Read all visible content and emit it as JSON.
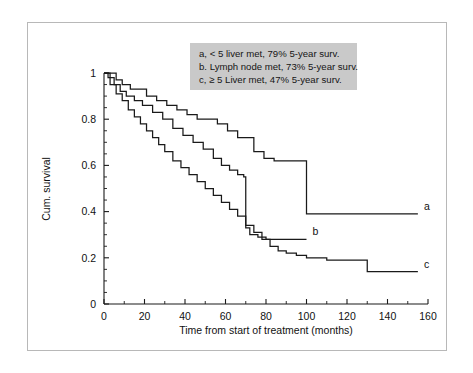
{
  "figure": {
    "legend": {
      "lines": [
        "a, < 5 liver met, 79% 5-year surv.",
        "b. Lymph node met, 73% 5-year surv.",
        "c, ≥ 5 Liver met, 47% 5-year surv."
      ]
    },
    "curve_labels": {
      "a": "a",
      "b": "b",
      "c": "c"
    }
  },
  "chart_data": {
    "type": "line",
    "title": "",
    "xlabel": "Time from start of treatment (months)",
    "ylabel": "Cum. survival",
    "xlim": [
      0,
      160
    ],
    "ylim": [
      0,
      1
    ],
    "xticks": [
      0,
      20,
      40,
      60,
      80,
      100,
      120,
      140,
      160
    ],
    "xtick_labels": [
      "0",
      "20",
      "40",
      "60",
      "80",
      "100",
      "120",
      "140",
      "160"
    ],
    "xminor_step": 10,
    "yticks": [
      0,
      0.2,
      0.4,
      0.6,
      0.8,
      1
    ],
    "ytick_labels": [
      "0",
      "0.2",
      "0.4",
      "0.6",
      "0.8",
      "1"
    ],
    "yminor_step": 0.05,
    "grid": false,
    "legend_position": "top-center",
    "step_style": "post",
    "series": [
      {
        "name": "a",
        "label": "a, < 5 liver met, 79% 5-year surv.",
        "five_year_survival": 0.79,
        "end_label": "a",
        "color": "#1a1a1a",
        "x": [
          0,
          3,
          6,
          9,
          13,
          17,
          21,
          26,
          31,
          36,
          41,
          46,
          51,
          56,
          61,
          66,
          70,
          74,
          79,
          84,
          89,
          100,
          155
        ],
        "y": [
          1.0,
          1.0,
          0.97,
          0.95,
          0.93,
          0.93,
          0.9,
          0.88,
          0.86,
          0.84,
          0.82,
          0.8,
          0.8,
          0.78,
          0.75,
          0.72,
          0.72,
          0.66,
          0.63,
          0.62,
          0.62,
          0.39,
          0.39
        ]
      },
      {
        "name": "b",
        "label": "b. Lymph node met, 73% 5-year surv.",
        "five_year_survival": 0.73,
        "end_label": "b",
        "color": "#1a1a1a",
        "x": [
          0,
          2,
          5,
          8,
          11,
          15,
          19,
          24,
          29,
          34,
          39,
          44,
          49,
          54,
          58,
          62,
          66,
          69,
          70,
          72,
          76,
          80,
          100
        ],
        "y": [
          1.0,
          0.98,
          0.95,
          0.92,
          0.9,
          0.88,
          0.86,
          0.83,
          0.8,
          0.76,
          0.73,
          0.7,
          0.67,
          0.63,
          0.6,
          0.58,
          0.56,
          0.55,
          0.33,
          0.3,
          0.29,
          0.28,
          0.28
        ]
      },
      {
        "name": "c",
        "label": "c, ≥ 5 Liver met, 47% 5-year surv.",
        "five_year_survival": 0.47,
        "end_label": "c",
        "color": "#1a1a1a",
        "x": [
          0,
          3,
          6,
          9,
          12,
          15,
          18,
          21,
          24,
          27,
          30,
          34,
          38,
          42,
          46,
          50,
          54,
          58,
          62,
          66,
          70,
          74,
          78,
          82,
          86,
          90,
          95,
          100,
          105,
          110,
          130,
          155
        ],
        "y": [
          1.0,
          0.95,
          0.91,
          0.88,
          0.84,
          0.81,
          0.78,
          0.75,
          0.72,
          0.69,
          0.66,
          0.62,
          0.59,
          0.56,
          0.53,
          0.5,
          0.47,
          0.44,
          0.41,
          0.38,
          0.34,
          0.31,
          0.28,
          0.25,
          0.23,
          0.22,
          0.21,
          0.2,
          0.2,
          0.19,
          0.14,
          0.14
        ]
      }
    ]
  }
}
